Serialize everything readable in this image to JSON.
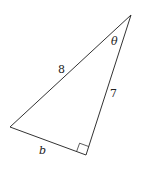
{
  "diagram": {
    "type": "right-triangle",
    "vertices": {
      "top": [
        131,
        15
      ],
      "left": [
        10,
        127
      ],
      "right_angle": [
        86,
        155
      ]
    },
    "line_color": "#333333",
    "labels": {
      "hypotenuse": "8",
      "vertical_leg": "7",
      "base_leg": "b",
      "angle": "θ"
    },
    "right_angle_marker": true
  }
}
